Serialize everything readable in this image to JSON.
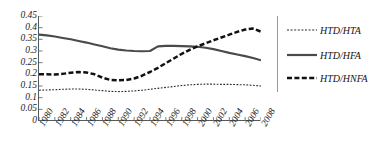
{
  "chart_data": {
    "type": "line",
    "title": "",
    "xlabel": "",
    "ylabel": "",
    "xlim": [
      1980,
      2008
    ],
    "ylim": [
      0,
      0.45
    ],
    "grid": false,
    "legend_position": "right",
    "y_ticks": [
      "0",
      "0.05",
      "0.1",
      "0.15",
      "0.2",
      "0.25",
      "0.3",
      "0.35",
      "0.4",
      "0.45"
    ],
    "y_tick_values": [
      0,
      0.05,
      0.1,
      0.15,
      0.2,
      0.25,
      0.3,
      0.35,
      0.4,
      0.45
    ],
    "x_ticks": [
      "1980",
      "1982",
      "1984",
      "1986",
      "1988",
      "1990",
      "1992",
      "1994",
      "1996",
      "1998",
      "2000",
      "2002",
      "2004",
      "2006",
      "2008"
    ],
    "x_tick_values": [
      1980,
      1982,
      1984,
      1986,
      1988,
      1990,
      1992,
      1994,
      1996,
      1998,
      2000,
      2002,
      2004,
      2006,
      2008
    ],
    "x": [
      1980,
      1981,
      1982,
      1983,
      1984,
      1985,
      1986,
      1987,
      1988,
      1989,
      1990,
      1991,
      1992,
      1993,
      1994,
      1995,
      1996,
      1997,
      1998,
      1999,
      2000,
      2001,
      2002,
      2003,
      2004,
      2005,
      2006,
      2007,
      2008
    ],
    "series": [
      {
        "name": "HTD/HTA",
        "style": "dotted",
        "color": "#2b2b2b",
        "values": [
          0.132,
          0.133,
          0.134,
          0.136,
          0.137,
          0.137,
          0.136,
          0.133,
          0.13,
          0.127,
          0.126,
          0.127,
          0.129,
          0.132,
          0.136,
          0.14,
          0.144,
          0.148,
          0.152,
          0.155,
          0.157,
          0.158,
          0.158,
          0.157,
          0.157,
          0.156,
          0.155,
          0.153,
          0.15
        ]
      },
      {
        "name": "HTD/HFA",
        "style": "solid",
        "color": "#4a4a4a",
        "values": [
          0.37,
          0.367,
          0.362,
          0.356,
          0.35,
          0.343,
          0.336,
          0.328,
          0.32,
          0.312,
          0.306,
          0.302,
          0.3,
          0.299,
          0.3,
          0.32,
          0.322,
          0.322,
          0.321,
          0.32,
          0.318,
          0.314,
          0.308,
          0.3,
          0.292,
          0.285,
          0.278,
          0.27,
          0.26
        ]
      },
      {
        "name": "HTD/HNFA",
        "style": "dashed",
        "color": "#111111",
        "values": [
          0.2,
          0.2,
          0.199,
          0.202,
          0.207,
          0.21,
          0.208,
          0.2,
          0.186,
          0.176,
          0.174,
          0.176,
          0.182,
          0.194,
          0.21,
          0.228,
          0.248,
          0.268,
          0.288,
          0.305,
          0.32,
          0.333,
          0.346,
          0.358,
          0.37,
          0.382,
          0.392,
          0.396,
          0.383
        ]
      }
    ]
  },
  "legend": {
    "items": [
      {
        "label": "HTD/HTA",
        "style": "dotted"
      },
      {
        "label": "HTD/HFA",
        "style": "solid"
      },
      {
        "label": "HTD/HNFA",
        "style": "dashed"
      }
    ]
  }
}
